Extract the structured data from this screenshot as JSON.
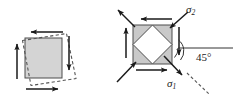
{
  "figure": {
    "title_visible": false,
    "background_color": "#ffffff",
    "panels": [
      {
        "id": "left-panel",
        "name": "shear-deformation-element",
        "description": "Square element under pure shear with dashed deformed parallelogram outline and four shear arrows",
        "element_fill": "#d4d4d4",
        "element_stroke": "#4d4d4d",
        "deformed_outline_style": "dashed",
        "arrows": [
          {
            "name": "top-shear-arrow",
            "direction": "left"
          },
          {
            "name": "bottom-shear-arrow",
            "direction": "right"
          },
          {
            "name": "left-shear-arrow",
            "direction": "up"
          },
          {
            "name": "right-shear-arrow",
            "direction": "down"
          }
        ]
      },
      {
        "id": "right-panel",
        "name": "principal-stress-element",
        "description": "Square element under pure shear with inscribed rotated square showing principal stress directions at 45 degrees",
        "element_fill": "#c9c9c9",
        "inner_fill": "#ffffff",
        "element_stroke": "#4d4d4d",
        "arrows": [
          {
            "name": "top-shear-arrow",
            "direction": "left"
          },
          {
            "name": "bottom-shear-arrow",
            "direction": "right"
          },
          {
            "name": "left-shear-arrow",
            "direction": "up"
          },
          {
            "name": "right-shear-arrow",
            "direction": "down"
          },
          {
            "name": "sigma2-compression-arrow-upper-right",
            "direction": "down-left"
          },
          {
            "name": "sigma2-compression-arrow-lower-left",
            "direction": "up-right"
          },
          {
            "name": "sigma1-tension-arrow-upper-left",
            "direction": "up-left"
          },
          {
            "name": "sigma1-tension-arrow-lower-right",
            "direction": "down-right"
          }
        ]
      }
    ],
    "labels": {
      "sigma2": {
        "text": "σ",
        "subscript": "2"
      },
      "sigma1": {
        "text": "σ",
        "subscript": "1"
      },
      "angle": "45°"
    },
    "colors": {
      "ink": "#1a1a1a",
      "line": "#333333",
      "element_fill_left": "#d4d4d4",
      "element_fill_right": "#c9c9c9",
      "element_stroke": "#4d4d4d",
      "dashed": "#555555",
      "inner_fill": "#ffffff"
    }
  }
}
